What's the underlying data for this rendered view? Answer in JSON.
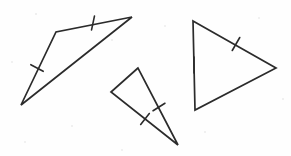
{
  "figure": {
    "background_color": "#fefefe",
    "stroke_color": "#2b2b2b",
    "width": 291,
    "height": 156,
    "shape_count": "3",
    "caption": ""
  },
  "shapes": [
    {
      "name": "triangle-left",
      "label": "Obtuse triangle, upper left",
      "vertices": [
        {
          "name": "apex-right",
          "x": 132,
          "y": 17
        },
        {
          "name": "bend-left",
          "x": 56,
          "y": 32
        },
        {
          "name": "bottom-left",
          "x": 21,
          "y": 105
        }
      ],
      "path": "M 132 17 L 56 32 L 21 105 Z",
      "tick_marks": [
        {
          "name": "tick-top-edge",
          "x": 93,
          "y": 23,
          "angle": -78,
          "length": 14,
          "count": 1
        },
        {
          "name": "tick-left-edge",
          "x": 37,
          "y": 68,
          "angle": 28,
          "length": 14,
          "count": 1
        }
      ]
    },
    {
      "name": "triangle-middle",
      "label": "Narrow triangle, lower middle",
      "vertices": [
        {
          "name": "apex-top",
          "x": 138,
          "y": 68
        },
        {
          "name": "vertex-left",
          "x": 111,
          "y": 92
        },
        {
          "name": "vertex-bottom-right",
          "x": 178,
          "y": 145
        }
      ],
      "path": "M 138 68 L 111 92 L 178 145 Z",
      "tick_marks": [
        {
          "name": "tick-right-edge",
          "x": 159,
          "y": 107,
          "angle": -32,
          "length": 14,
          "count": 1
        },
        {
          "name": "tick-bottom-edge",
          "x": 145,
          "y": 119,
          "angle": -52,
          "length": 14,
          "count": 1
        }
      ]
    },
    {
      "name": "triangle-right",
      "label": "Triangle pointing right",
      "vertices": [
        {
          "name": "vertex-top-left",
          "x": 193,
          "y": 21
        },
        {
          "name": "vertex-right",
          "x": 276,
          "y": 68
        },
        {
          "name": "vertex-bottom-left",
          "x": 195,
          "y": 110
        }
      ],
      "path": "M 193 21 L 276 68 L 195 110 Z",
      "tick_marks": [
        {
          "name": "tick-upper-right-edge",
          "x": 236,
          "y": 44,
          "angle": -60,
          "length": 15,
          "count": 1
        },
        {
          "name": "tick-left-edge",
          "x": 194,
          "y": 65,
          "angle": 90,
          "length": 16,
          "count": 1
        }
      ]
    }
  ],
  "specks": [
    {
      "x": 36,
      "y": 14,
      "r": 1.1
    },
    {
      "x": 12,
      "y": 62,
      "r": 0.9
    },
    {
      "x": 112,
      "y": 40,
      "r": 1.0
    },
    {
      "x": 165,
      "y": 26,
      "r": 0.9
    },
    {
      "x": 205,
      "y": 132,
      "r": 1.0
    },
    {
      "x": 72,
      "y": 126,
      "r": 1.0
    },
    {
      "x": 259,
      "y": 18,
      "r": 0.9
    },
    {
      "x": 283,
      "y": 99,
      "r": 1.0
    },
    {
      "x": 25,
      "y": 142,
      "r": 0.9
    },
    {
      "x": 122,
      "y": 150,
      "r": 0.9
    }
  ]
}
